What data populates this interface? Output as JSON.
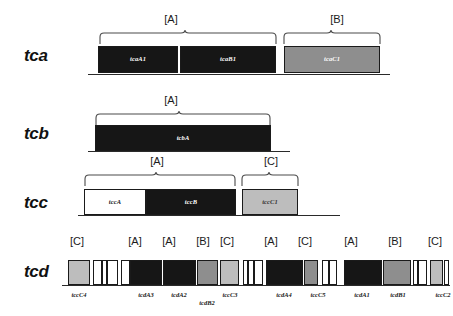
{
  "figure": {
    "type": "gene-cluster-diagram",
    "colors": {
      "class_a_fill": "#161616",
      "class_b_fill": "#8e8e8e",
      "class_c_fill": "#bdbdbd",
      "spacer_fill": "#ffffff",
      "outline": "#1a1a1a",
      "baseline": "#2a2a2a"
    },
    "class_legend": [
      "[A]",
      "[B]",
      "[C]"
    ]
  },
  "loci": [
    {
      "name": "tca",
      "genes": [
        {
          "label": "tcaA1",
          "class": "A",
          "fill": "black"
        },
        {
          "label": "tcaB1",
          "class": "A",
          "fill": "black"
        },
        {
          "label": "tcaC1",
          "class": "B",
          "fill": "gray"
        }
      ],
      "brackets": [
        {
          "label": "[A]"
        },
        {
          "label": "[B]"
        }
      ]
    },
    {
      "name": "tcb",
      "genes": [
        {
          "label": "tcbA",
          "class": "A",
          "fill": "black"
        }
      ],
      "brackets": [
        {
          "label": "[A]"
        }
      ]
    },
    {
      "name": "tcc",
      "genes": [
        {
          "label": "tccA",
          "class": "",
          "fill": "white"
        },
        {
          "label": "tccB",
          "class": "A",
          "fill": "black"
        },
        {
          "label": "tccC1",
          "class": "C",
          "fill": "ltgray"
        }
      ],
      "brackets": [
        {
          "label": "[A]"
        },
        {
          "label": "[C]"
        }
      ]
    },
    {
      "name": "tcd",
      "genes": [
        {
          "label": "tccC4",
          "class": "C",
          "fill": "ltgray"
        },
        {
          "label": "",
          "class": "",
          "fill": "white"
        },
        {
          "label": "",
          "class": "",
          "fill": "white"
        },
        {
          "label": "",
          "class": "",
          "fill": "white"
        },
        {
          "label": "",
          "class": "",
          "fill": "white"
        },
        {
          "label": "tcdA3",
          "class": "A",
          "fill": "black"
        },
        {
          "label": "tcdA2",
          "class": "A",
          "fill": "black"
        },
        {
          "label": "tcdB2",
          "class": "B",
          "fill": "gray"
        },
        {
          "label": "tccC3",
          "class": "C",
          "fill": "ltgray"
        },
        {
          "label": "",
          "class": "",
          "fill": "white"
        },
        {
          "label": "",
          "class": "",
          "fill": "white"
        },
        {
          "label": "",
          "class": "",
          "fill": "white"
        },
        {
          "label": "tcdA4",
          "class": "A",
          "fill": "black"
        },
        {
          "label": "tccC5",
          "class": "C",
          "fill": "ltgray"
        },
        {
          "label": "",
          "class": "",
          "fill": "white"
        },
        {
          "label": "",
          "class": "",
          "fill": "white"
        },
        {
          "label": "tcdA1",
          "class": "A",
          "fill": "black"
        },
        {
          "label": "tcdB1",
          "class": "B",
          "fill": "gray"
        },
        {
          "label": "",
          "class": "",
          "fill": "white"
        },
        {
          "label": "",
          "class": "",
          "fill": "white"
        },
        {
          "label": "tccC2",
          "class": "C",
          "fill": "ltgray"
        },
        {
          "label": "",
          "class": "",
          "fill": "white"
        }
      ],
      "brackets": [
        {
          "label": "[C]"
        },
        {
          "label": "[A]"
        },
        {
          "label": "[A]"
        },
        {
          "label": "[B]"
        },
        {
          "label": "[C]"
        },
        {
          "label": "[A]"
        },
        {
          "label": "[C]"
        },
        {
          "label": "[A]"
        },
        {
          "label": "[B]"
        },
        {
          "label": "[C]"
        }
      ]
    }
  ]
}
